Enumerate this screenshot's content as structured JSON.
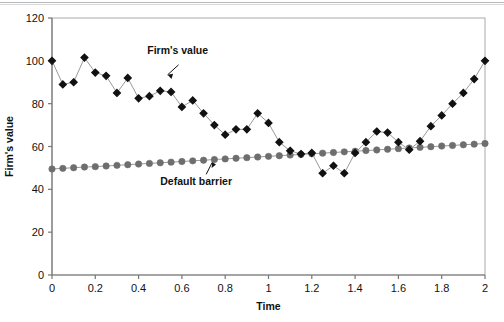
{
  "chart_data": {
    "type": "line",
    "title": "",
    "xlabel": "Time",
    "ylabel": "Firm's value",
    "xlim": [
      0,
      2
    ],
    "ylim": [
      0,
      120
    ],
    "xticks": [
      "0",
      "0.2",
      "0.4",
      "0.6",
      "0.8",
      "1",
      "1.2",
      "1.4",
      "1.6",
      "1.8",
      "2"
    ],
    "yticks": [
      "0",
      "20",
      "40",
      "60",
      "80",
      "100",
      "120"
    ],
    "grid": false,
    "legend_position": "inline-annotations",
    "annotations": [
      {
        "text": "Firm's value",
        "x": 0.44,
        "y": 103,
        "arrow_to": [
          0.52,
          93
        ]
      },
      {
        "text": "Default barrier",
        "x": 0.5,
        "y": 42,
        "arrow_to": [
          0.74,
          54
        ]
      }
    ],
    "x": [
      0,
      0.05,
      0.1,
      0.15,
      0.2,
      0.25,
      0.3,
      0.35,
      0.4,
      0.45,
      0.5,
      0.55,
      0.6,
      0.65,
      0.7,
      0.75,
      0.8,
      0.85,
      0.9,
      0.95,
      1,
      1.05,
      1.1,
      1.15,
      1.2,
      1.25,
      1.3,
      1.35,
      1.4,
      1.45,
      1.5,
      1.55,
      1.6,
      1.65,
      1.7,
      1.75,
      1.8,
      1.85,
      1.9,
      1.95,
      2
    ],
    "series": [
      {
        "name": "Firm's value",
        "marker": "diamond",
        "color": "#111111",
        "values": [
          100,
          89,
          90,
          101.5,
          94.5,
          93,
          85,
          92,
          82.5,
          83.5,
          86,
          85.5,
          78.5,
          81.5,
          75.5,
          70,
          65.5,
          68,
          68,
          75.5,
          71,
          62,
          58,
          56.5,
          57,
          47.5,
          51,
          47.5,
          57,
          62,
          67,
          66.5,
          62,
          58.5,
          62.5,
          69.5,
          74.5,
          80,
          85,
          91.5,
          100
        ]
      },
      {
        "name": "Default barrier",
        "marker": "circle",
        "color": "#6e6e6e",
        "values": [
          49.5,
          49.8,
          50.1,
          50.4,
          50.6,
          50.9,
          51.2,
          51.5,
          51.8,
          52.1,
          52.4,
          52.7,
          53,
          53.3,
          53.6,
          53.9,
          54.2,
          54.5,
          54.8,
          55.1,
          55.4,
          55.7,
          56,
          56.3,
          56.6,
          56.9,
          57.2,
          57.5,
          57.8,
          58.1,
          58.4,
          58.7,
          59,
          59.3,
          59.6,
          59.9,
          60.2,
          60.5,
          60.8,
          61.1,
          61.4
        ]
      }
    ]
  }
}
